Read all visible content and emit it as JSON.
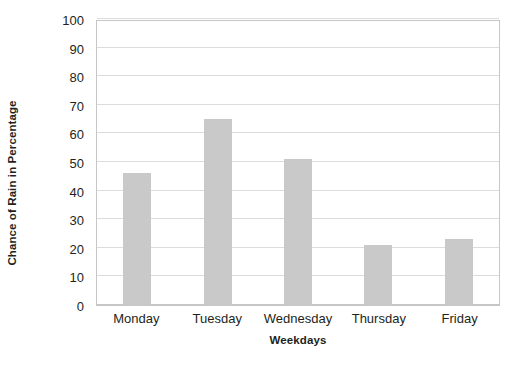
{
  "chart_data": {
    "type": "bar",
    "title": "",
    "subtitle": "",
    "xlabel": "Weekdays",
    "ylabel": "Chance of Rain in Percentage",
    "categories": [
      "Monday",
      "Tuesday",
      "Wednesday",
      "Thursday",
      "Friday"
    ],
    "values": [
      46,
      65,
      51,
      21,
      23
    ],
    "ylim": [
      0,
      100
    ],
    "ytick_step": 10,
    "yticks": [
      0,
      10,
      20,
      30,
      40,
      50,
      60,
      70,
      80,
      90,
      100
    ],
    "ytick_labels": [
      "0",
      "10",
      "20",
      "30",
      "40",
      "50",
      "60",
      "70",
      "80",
      "90",
      "100"
    ],
    "grid": true,
    "grid_axis": "y",
    "legend": false,
    "legend_position": "none",
    "bar_color": "#c9c9c9",
    "gridline_color": "#dcdcdc",
    "axis_color": "#c6c6c6",
    "background_color": "#ffffff",
    "text_color": "#231f20"
  }
}
